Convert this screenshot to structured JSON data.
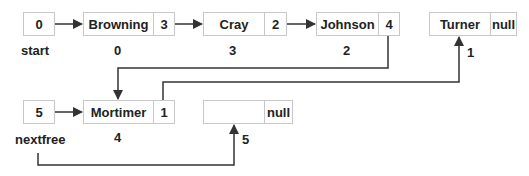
{
  "diagram": {
    "pointers": {
      "start": {
        "value": "0",
        "label": "start"
      },
      "nextfree": {
        "value": "5",
        "label": "nextfree"
      }
    },
    "nodes": [
      {
        "index": "0",
        "name": "Browning",
        "next": "3"
      },
      {
        "index": "3",
        "name": "Cray",
        "next": "2"
      },
      {
        "index": "2",
        "name": "Johnson",
        "next": "4"
      },
      {
        "index": "1",
        "name": "Turner",
        "next": "null"
      },
      {
        "index": "4",
        "name": "Mortimer",
        "next": "1"
      },
      {
        "index": "5",
        "name": "",
        "next": "null"
      }
    ],
    "colors": {
      "line": "#333333",
      "border": "#c8c8c8",
      "text": "#222222"
    }
  }
}
